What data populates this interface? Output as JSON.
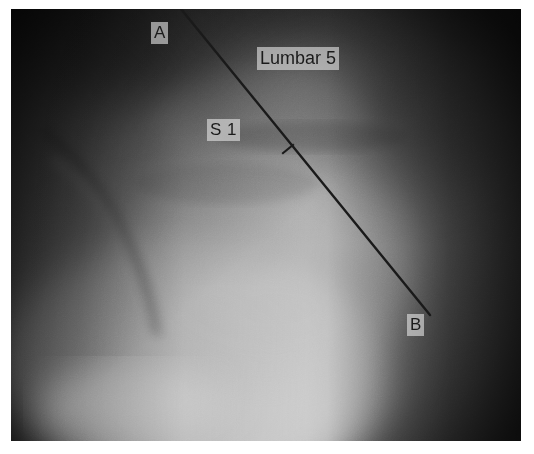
{
  "image": {
    "modality": "x-ray radiograph",
    "region": "lumbosacral spine, lateral view",
    "plate": {
      "x": 11,
      "y": 9,
      "width": 510,
      "height": 432,
      "background_color": "#ffffff",
      "film_dark_color": "#2b2b2b",
      "film_bright_color": "#fafafa"
    }
  },
  "annotations": {
    "line": {
      "name": "measurement-line-A-B",
      "color": "#1a1a1a",
      "stroke_width": 2.4,
      "start": {
        "label": "A",
        "x": 170,
        "y": 0
      },
      "end": {
        "label": "B",
        "x": 419,
        "y": 306
      }
    },
    "tick": {
      "name": "midpoint-tick-mark",
      "color": "#1a1a1a",
      "stroke_width": 2.2,
      "center": {
        "x": 277,
        "y": 140
      },
      "length": 15
    },
    "labels": [
      {
        "id": "A",
        "text": "A",
        "x": 140,
        "y": 13,
        "font_size": 17
      },
      {
        "id": "B",
        "text": "B",
        "x": 396,
        "y": 305,
        "font_size": 17
      },
      {
        "id": "S1",
        "text": "S 1",
        "x": 196,
        "y": 110,
        "font_size": 17
      },
      {
        "id": "lumbar5",
        "text": "Lumbar 5",
        "x": 246,
        "y": 38,
        "font_size": 18
      }
    ],
    "label_text": {
      "point_a": "A",
      "point_b": "B",
      "sacral_one": "S 1",
      "lumbar_five": "Lumbar 5"
    },
    "label_background": "rgba(226, 226, 226, 0.62)",
    "label_color": "#1b1b1b"
  },
  "chart_data": {
    "type": "scatter",
    "xlabel": "",
    "ylabel": "",
    "annotations": [
      "A",
      "B",
      "S 1",
      "Lumbar 5"
    ],
    "series": [
      {
        "name": "reference-line-A-B",
        "x": [
          170,
          419
        ],
        "y": [
          0,
          306
        ]
      },
      {
        "name": "midpoint-tick",
        "x": [
          277
        ],
        "y": [
          140
        ]
      }
    ]
  }
}
